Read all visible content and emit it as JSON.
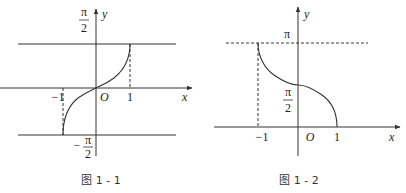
{
  "figures": [
    {
      "id": "fig-1-1",
      "caption": "图 1 - 1",
      "function": "y = arcsin x",
      "labels": {
        "x_axis": "x",
        "y_axis": "y",
        "origin": "O",
        "x_neg_one": "−1",
        "x_one": "1",
        "y_top_num": "π",
        "y_top_den": "2",
        "y_bottom_sign": "−",
        "y_bottom_num": "π",
        "y_bottom_den": "2"
      },
      "domain": [
        -1,
        1
      ],
      "range_labels": [
        "−π/2",
        "π/2"
      ],
      "reference_lines": [
        {
          "type": "solid-horizontal",
          "y": "π/2"
        },
        {
          "type": "solid-horizontal",
          "y": "−π/2"
        },
        {
          "type": "dashed-vertical",
          "x": 1
        },
        {
          "type": "dashed-vertical",
          "x": -1
        }
      ]
    },
    {
      "id": "fig-1-2",
      "caption": "图 1 - 2",
      "function": "y = arccos x",
      "labels": {
        "x_axis": "x",
        "y_axis": "y",
        "origin": "O",
        "x_neg_one": "−1",
        "x_one": "1",
        "y_pi": "π",
        "y_mid_num": "π",
        "y_mid_den": "2"
      },
      "domain": [
        -1,
        1
      ],
      "range_labels": [
        "0",
        "π"
      ],
      "reference_lines": [
        {
          "type": "dashed-horizontal",
          "y": "π"
        },
        {
          "type": "dashed-vertical",
          "x": -1
        }
      ]
    }
  ],
  "colors": {
    "ink": "#333333",
    "background": "#ffffff"
  }
}
